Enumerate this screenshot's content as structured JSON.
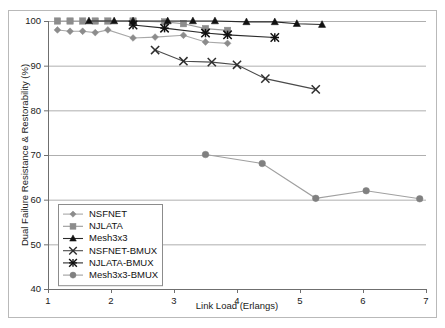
{
  "chart_data": {
    "type": "line",
    "title": "",
    "xlabel": "Link Load (Erlangs)",
    "ylabel": "Dual Failure Resistance & Restorability (%)",
    "xlim": [
      1,
      7
    ],
    "ylim": [
      40,
      100
    ],
    "xticks": [
      1,
      2,
      3,
      4,
      5,
      6,
      7
    ],
    "yticks": [
      40,
      50,
      60,
      70,
      80,
      90,
      100
    ],
    "grid": "horizontal",
    "legend_position": "inner-lower-left",
    "series": [
      {
        "name": "NSFNET",
        "marker": "diamond",
        "color": "#8c8c8c",
        "line_color": "#a8a8a8",
        "x": [
          1.15,
          1.35,
          1.55,
          1.75,
          1.95,
          2.35,
          2.7,
          3.15,
          3.5,
          3.85
        ],
        "y": [
          98.0,
          97.7,
          97.7,
          97.4,
          98.0,
          96.2,
          96.4,
          96.8,
          95.3,
          95.0
        ]
      },
      {
        "name": "NJLATA",
        "marker": "square",
        "color": "#8c8c8c",
        "line_color": "#9a9a9a",
        "x": [
          1.15,
          1.35,
          1.55,
          1.75,
          1.95,
          2.35,
          2.85,
          3.15,
          3.5,
          3.85
        ],
        "y": [
          100.0,
          100.0,
          100.0,
          100.0,
          100.0,
          100.0,
          99.8,
          99.4,
          98.3,
          97.9
        ]
      },
      {
        "name": "Mesh3x3",
        "marker": "triangle",
        "color": "#111111",
        "line_color": "#2a2a2a",
        "x": [
          1.65,
          2.05,
          2.35,
          2.9,
          3.3,
          3.65,
          4.15,
          4.6,
          4.95,
          5.35
        ],
        "y": [
          100.0,
          100.0,
          100.0,
          100.0,
          100.0,
          100.0,
          99.8,
          99.8,
          99.4,
          99.2
        ]
      },
      {
        "name": "NSFNET-BMUX",
        "marker": "x",
        "color": "#2e2e2e",
        "line_color": "#4a4a4a",
        "x": [
          2.7,
          3.15,
          3.6,
          4.0,
          4.45,
          5.25
        ],
        "y": [
          93.5,
          91.0,
          90.8,
          90.2,
          87.1,
          84.7
        ]
      },
      {
        "name": "NJLATA-BMUX",
        "marker": "star",
        "color": "#111111",
        "line_color": "#2a2a2a",
        "x": [
          2.35,
          2.85,
          3.5,
          3.85,
          4.6
        ],
        "y": [
          99.1,
          98.4,
          97.3,
          96.9,
          96.3
        ]
      },
      {
        "name": "Mesh3x3-BMUX",
        "marker": "circle",
        "color": "#808080",
        "line_color": "#a0a0a0",
        "x": [
          3.5,
          4.4,
          5.25,
          6.05,
          6.9
        ],
        "y": [
          70.1,
          68.1,
          60.3,
          62.0,
          60.2
        ]
      }
    ]
  },
  "legend": {
    "entries": [
      {
        "label": "NSFNET"
      },
      {
        "label": "NJLATA"
      },
      {
        "label": "Mesh3x3"
      },
      {
        "label": "NSFNET-BMUX"
      },
      {
        "label": "NJLATA-BMUX"
      },
      {
        "label": "Mesh3x3-BMUX"
      }
    ]
  },
  "axes": {
    "y_tick_labels": [
      "40",
      "50",
      "60",
      "70",
      "80",
      "90",
      "100"
    ],
    "x_tick_labels": [
      "1",
      "2",
      "3",
      "4",
      "5",
      "6",
      "7"
    ],
    "y_title": "Dual Failure Resistance & Restorability (%)",
    "x_title": "Link Load (Erlangs)"
  }
}
